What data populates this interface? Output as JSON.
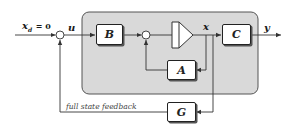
{
  "diagram": {
    "type": "block-diagram",
    "colors": {
      "plant_background": "#d9d9d9",
      "plant_border": "#555555",
      "line": "#333333",
      "block_fill": "#ffffff"
    },
    "signals": {
      "reference": "x",
      "reference_subscript": "d",
      "reference_value": "= 0",
      "control": "u",
      "state": "x",
      "output": "y"
    },
    "blocks": {
      "B": "B",
      "A": "A",
      "C": "C",
      "G": "G"
    },
    "annotations": {
      "feedback_label": "full state feedback"
    }
  }
}
